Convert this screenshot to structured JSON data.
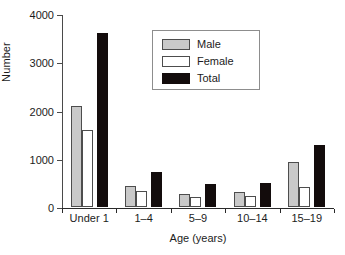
{
  "chart_data": {
    "type": "bar",
    "title": "",
    "subtitle": "",
    "xlabel": "Age (years)",
    "ylabel": "Number",
    "categories": [
      "Under 1",
      "1–4",
      "5–9",
      "10–14",
      "15–19"
    ],
    "series": [
      {
        "name": "Male",
        "color": "#c9c9c9",
        "values": [
          2100,
          435,
          270,
          310,
          930
        ]
      },
      {
        "name": "Female",
        "color": "#ffffff",
        "values": [
          1600,
          330,
          210,
          230,
          410
        ]
      },
      {
        "name": "Total",
        "color": "#130c0c",
        "values": [
          3600,
          725,
          475,
          500,
          1285
        ]
      }
    ],
    "ylim": [
      0,
      4000
    ],
    "yticks": [
      0,
      1000,
      2000,
      3000,
      4000
    ],
    "ytick_labels": [
      "0",
      "1000",
      "2000",
      "3000",
      "4000"
    ],
    "grid": false,
    "legend_position": "upper center",
    "legend_entries": [
      "Male",
      "Female",
      "Total"
    ]
  },
  "legend": {
    "male_label": "Male",
    "female_label": "Female",
    "total_label": "Total"
  },
  "axes": {
    "x_title": "Age (years)",
    "y_title": "Number"
  }
}
